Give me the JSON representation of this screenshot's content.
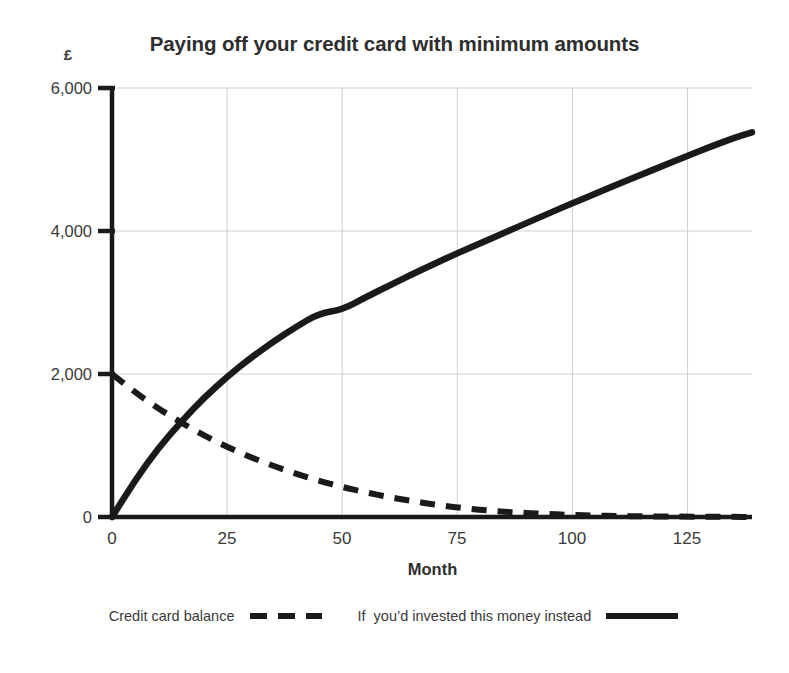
{
  "chart_data": {
    "type": "line",
    "title": "Paying off your credit card with minimum amounts",
    "xlabel": "Month",
    "ylabel": "£",
    "xlim": [
      0,
      139
    ],
    "ylim": [
      0,
      6000
    ],
    "xticks": [
      0,
      25,
      50,
      75,
      100,
      125
    ],
    "xtick_labels": [
      "0",
      "25",
      "50",
      "75",
      "100",
      "125"
    ],
    "yticks": [
      0,
      2000,
      4000,
      6000
    ],
    "ytick_labels": [
      "0",
      "2,000",
      "4,000",
      "6,000"
    ],
    "grid": true,
    "grid_color": "#c9c9c9",
    "axis_color": "#1a1a1a",
    "legend_position": "below-center",
    "x": [
      0,
      5,
      10,
      15,
      20,
      25,
      30,
      35,
      40,
      45,
      50,
      55,
      60,
      65,
      70,
      75,
      80,
      85,
      90,
      95,
      100,
      105,
      110,
      115,
      120,
      125,
      130,
      135,
      139
    ],
    "series": [
      {
        "name": "Credit card balance",
        "style": "dashed",
        "color": "#1a1a1a",
        "values": [
          2000,
          1745,
          1520,
          1320,
          1140,
          980,
          840,
          715,
          605,
          505,
          420,
          345,
          280,
          225,
          175,
          135,
          100,
          75,
          55,
          40,
          28,
          20,
          14,
          10,
          7,
          5,
          3,
          2,
          1
        ]
      },
      {
        "name": "If  you’d invested this money instead",
        "style": "solid",
        "color": "#1a1a1a",
        "values": [
          0,
          510,
          960,
          1330,
          1670,
          1960,
          2220,
          2450,
          2660,
          2850,
          2900,
          3070,
          3230,
          3390,
          3540,
          3690,
          3830,
          3970,
          4110,
          4250,
          4390,
          4520,
          4660,
          4790,
          4920,
          5050,
          5180,
          5300,
          5380
        ]
      }
    ]
  },
  "legend": {
    "entries": [
      {
        "label": "Credit card balance",
        "style": "dashed"
      },
      {
        "label": "If  you’d invested this money instead",
        "style": "solid"
      }
    ]
  }
}
